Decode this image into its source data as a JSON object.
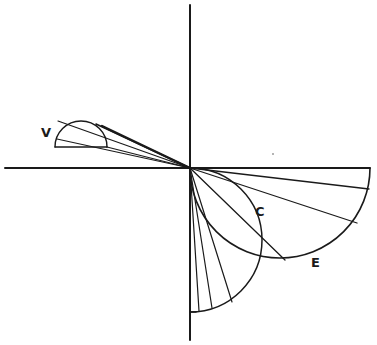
{
  "diagram": {
    "origin": [
      190,
      168
    ],
    "axes": {
      "horizontal": {
        "x1": 5,
        "y": 168,
        "x2": 370
      },
      "vertical": {
        "x": 190,
        "y1": 5,
        "y2": 340
      }
    },
    "curves": [
      {
        "label": "V",
        "type": "semicircle-upper",
        "center": [
          81,
          147
        ],
        "radius": 26,
        "label_pos": [
          41,
          126
        ]
      },
      {
        "label": "C",
        "type": "semicircle-right",
        "center": [
          190,
          240
        ],
        "radius": 72,
        "label_pos": [
          255,
          205
        ]
      },
      {
        "label": "E",
        "type": "semicircle-lower",
        "center": [
          280,
          168
        ],
        "radius": 90,
        "label_pos": [
          311,
          256
        ]
      }
    ],
    "rays": {
      "V": [
        [
          58,
          121
        ],
        [
          96,
          124
        ],
        [
          102,
          126
        ],
        [
          107,
          147
        ],
        [
          55,
          140
        ]
      ],
      "E": [
        [
          370,
          168
        ],
        [
          369,
          189
        ],
        [
          357,
          223
        ],
        [
          285,
          260
        ]
      ],
      "C": [
        [
          190,
          312
        ],
        [
          199,
          311
        ],
        [
          212,
          308
        ],
        [
          232,
          302
        ]
      ]
    },
    "labels": {
      "v": "V",
      "c": "C",
      "e": "E"
    }
  }
}
